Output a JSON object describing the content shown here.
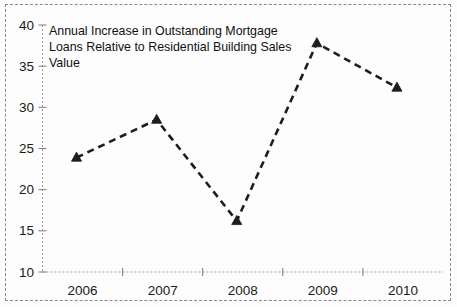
{
  "figure": {
    "frame_color": "#8a8a8a",
    "background_color": "#fdfdfd"
  },
  "chart_data": {
    "type": "line",
    "title": "Annual Increase in Outstanding Mortgage Loans Relative to Residential Building Sales Value",
    "title_lines": [
      "Annual Increase in Outstanding Mortgage",
      "Loans Relative to Residential Building Sales",
      "Value"
    ],
    "title_position": "inside-top-left",
    "xlabel": "",
    "ylabel": "",
    "categories": [
      "2006",
      "2007",
      "2008",
      "2009",
      "2010"
    ],
    "x": [
      2006,
      2007,
      2008,
      2009,
      2010
    ],
    "values": [
      23.9,
      28.5,
      16.2,
      37.8,
      32.4
    ],
    "series": [
      {
        "name": "Annual Increase in Outstanding Mortgage Loans Relative to Residential Building Sales Value",
        "values": [
          23.9,
          28.5,
          16.2,
          37.8,
          32.4
        ],
        "color": "#1d1d1d",
        "line_style": "dashed",
        "marker": "triangle-up"
      }
    ],
    "ylim": [
      10,
      40
    ],
    "yticks": [
      10,
      15,
      20,
      25,
      30,
      35,
      40
    ],
    "ytick_labels": [
      "10",
      "15",
      "20",
      "25",
      "30",
      "35",
      "40"
    ],
    "xtick_labels": [
      "2006",
      "2007",
      "2008",
      "2009",
      "2010"
    ],
    "grid": false,
    "legend": false,
    "legend_position": "none",
    "line_color": "#1d1d1d",
    "marker_color": "#1d1d1d",
    "axis_color": "#9a9a9a"
  }
}
